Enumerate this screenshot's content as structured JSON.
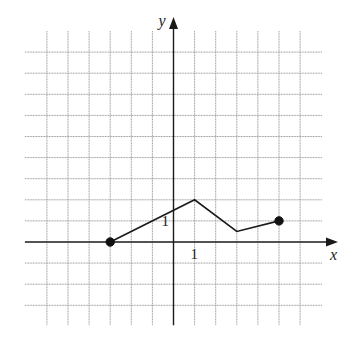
{
  "chart_data": {
    "type": "line",
    "title": "",
    "xlabel": "x",
    "ylabel": "y",
    "xlim": [
      -6,
      6
    ],
    "ylim": [
      -3,
      9
    ],
    "grid": true,
    "tick_labels": {
      "x": [
        {
          "value": 1,
          "label": "1"
        }
      ],
      "y": [
        {
          "value": 1,
          "label": "1"
        }
      ]
    },
    "series": [
      {
        "name": "f",
        "points": [
          {
            "x": -3,
            "y": 0
          },
          {
            "x": 1,
            "y": 2
          },
          {
            "x": 3,
            "y": 0.5
          },
          {
            "x": 5,
            "y": 1
          }
        ],
        "endpoints": [
          {
            "x": -3,
            "y": 0,
            "closed": true
          },
          {
            "x": 5,
            "y": 1,
            "closed": true
          }
        ]
      }
    ],
    "colors": {
      "line": "#1a1a1a",
      "grid": "#9a9a9a",
      "background": "#ffffff"
    }
  }
}
